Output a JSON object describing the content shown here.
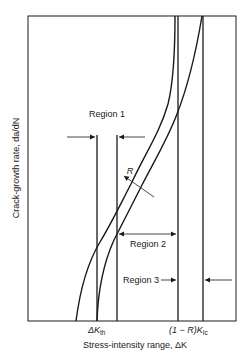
{
  "diagram": {
    "title": "",
    "type": "fatigue crack growth rate vs stress-intensity range (log-log schematic)",
    "axes": {
      "xlabel": "Stress-intensity range, ΔK",
      "ylabel": "Crack-growth rate, da/dN"
    },
    "x_markers": [
      {
        "id": "dk_th",
        "label_main": "ΔK",
        "label_sub": "th"
      },
      {
        "id": "one_minus_r_kic",
        "label_main": "(1 − R)K",
        "label_sub": "Ic"
      }
    ],
    "regions": [
      {
        "id": "region1",
        "label": "Region 1"
      },
      {
        "id": "region2",
        "label": "Region 2"
      },
      {
        "id": "region3",
        "label": "Region 3"
      }
    ],
    "annotations": {
      "r_arrow_label": "R"
    },
    "colors": {
      "line": "#1a1a1a",
      "background": "#ffffff"
    }
  }
}
